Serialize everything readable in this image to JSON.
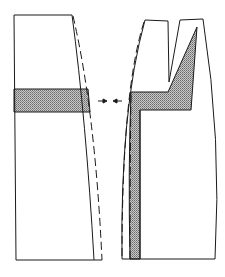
{
  "figure": {
    "type": "technical line drawing",
    "colors": {
      "line": "#1a1a1a",
      "shade": "#9a9a9a",
      "background": "#ffffff"
    },
    "parts": [
      {
        "name": "left-block",
        "shaded_band": true
      },
      {
        "name": "right-block",
        "teeth": 2,
        "shaded_layer": "L-shaped with triangular tooth fill"
      }
    ],
    "annotations": [
      {
        "name": "gap-arrows",
        "kind": "dimension arrows pointing inward toward gap"
      }
    ]
  }
}
